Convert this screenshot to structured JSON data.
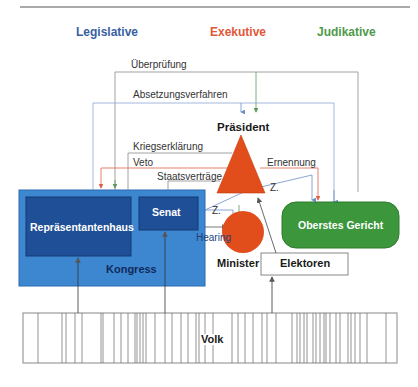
{
  "headers": {
    "legislative": {
      "label": "Legislative",
      "color": "#3a5fa0"
    },
    "executive": {
      "label": "Exekutive",
      "color": "#e2583a"
    },
    "judicial": {
      "label": "Judikative",
      "color": "#4e9a4a"
    }
  },
  "colors": {
    "congress_fill": "#3d87d1",
    "chamber_fill": "#1f4f96",
    "president_fill": "#e24e1b",
    "court_fill": "#3c963c",
    "line_gray": "#7a7a7a",
    "line_blue": "#6b8ec9",
    "line_red": "#e0604a",
    "line_green": "#5c9a5c"
  },
  "nodes": {
    "president": "Präsident",
    "minister": "Minister",
    "electors": "Elektoren",
    "court": "Oberstes Gericht",
    "house": "Repräsentantenhaus",
    "senate": "Senat",
    "congress": "Kongress",
    "people": "Volk"
  },
  "relations": {
    "review": "Überprüfung",
    "impeachment": "Absetzungsverfahren",
    "war_declaration": "Kriegserklärung",
    "veto": "Veto",
    "treaties": "Staatsverträge",
    "appointment": "Ernennung",
    "consent_senate": "Z.",
    "consent_court": "Z.",
    "hearing": "Hearing"
  },
  "people_bar_lines": [
    38,
    62,
    66,
    75,
    82,
    101,
    103,
    114,
    121,
    128,
    135,
    137,
    140,
    143,
    146,
    155,
    165,
    172,
    181,
    188,
    196,
    199,
    205,
    213,
    232,
    238,
    245,
    253,
    262,
    267,
    276,
    292,
    297,
    300,
    304,
    307,
    313,
    316,
    320,
    324,
    326,
    330,
    336,
    340,
    348,
    351,
    355,
    360,
    367,
    386
  ]
}
